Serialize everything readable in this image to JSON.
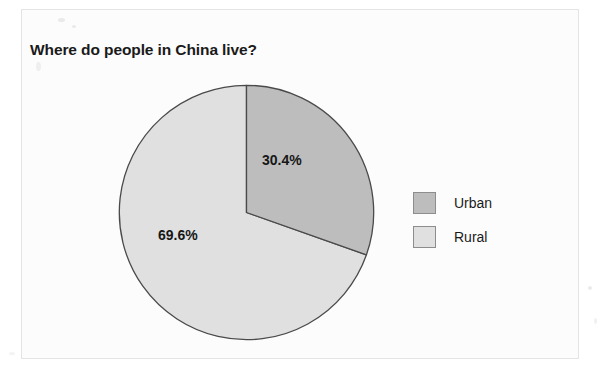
{
  "chart_data": {
    "type": "pie",
    "title": "Where do people in China live?",
    "categories": [
      "Urban",
      "Rural"
    ],
    "values": [
      30.4,
      69.6
    ],
    "value_labels": [
      "30.4%",
      "69.6%"
    ],
    "units": "percent",
    "start_angle_deg": 0,
    "direction": "clockwise",
    "legend_position": "right",
    "grid": false,
    "xlabel": "",
    "ylabel": "",
    "slice_colors": [
      "#bdbdbd",
      "#e0e0e0"
    ],
    "outline_color": "#4a4a4a",
    "slices": [
      {
        "name": "Urban",
        "value": 30.4,
        "label": "30.4%",
        "color": "#bdbdbd"
      },
      {
        "name": "Rural",
        "value": 69.6,
        "label": "69.6%",
        "color": "#e0e0e0"
      }
    ]
  },
  "title": {
    "text": "Where do people in China live?"
  },
  "labels": {
    "urban_pct": "30.4%",
    "rural_pct": "69.6%"
  },
  "legend": {
    "items": [
      {
        "label": "Urban",
        "color": "#bdbdbd"
      },
      {
        "label": "Rural",
        "color": "#e0e0e0"
      }
    ]
  },
  "colors": {
    "urban": "#bdbdbd",
    "rural": "#e0e0e0",
    "outline": "#4a4a4a",
    "text": "#1a1a1a",
    "page": "#fcfcfc"
  }
}
